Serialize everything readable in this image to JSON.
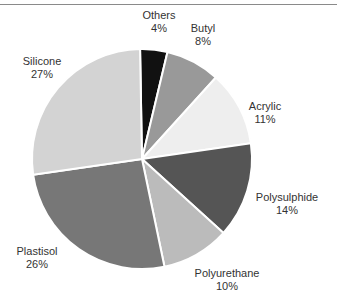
{
  "chart_data": {
    "type": "pie",
    "title": "",
    "categories": [
      "Others",
      "Butyl",
      "Acrylic",
      "Polysulphide",
      "Polyurethane",
      "Plastisol",
      "Silicone"
    ],
    "values": [
      4,
      8,
      11,
      14,
      10,
      26,
      27
    ],
    "unit": "%",
    "colors": [
      "#111111",
      "#999999",
      "#eeeeee",
      "#555555",
      "#bbbbbb",
      "#777777",
      "#d3d3d3"
    ],
    "start_angle_deg": -1,
    "direction": "clockwise",
    "legend": "none (labels outside slices)"
  },
  "labels": [
    {
      "name": "Others",
      "pct": "4%",
      "x": 159,
      "y": 9
    },
    {
      "name": "Butyl",
      "pct": "8%",
      "x": 203,
      "y": 22
    },
    {
      "name": "Acrylic",
      "pct": "11%",
      "x": 265,
      "y": 100
    },
    {
      "name": "Polysulphide",
      "pct": "14%",
      "x": 287,
      "y": 191
    },
    {
      "name": "Polyurethane",
      "pct": "10%",
      "x": 227,
      "y": 267
    },
    {
      "name": "Plastisol",
      "pct": "26%",
      "x": 37,
      "y": 245
    },
    {
      "name": "Silicone",
      "pct": "27%",
      "x": 42,
      "y": 55
    }
  ]
}
